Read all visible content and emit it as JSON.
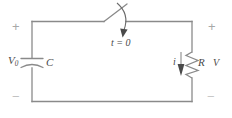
{
  "diagram": {
    "type": "schematic",
    "stroke_color": "#808080",
    "text_color": "#4a4a4a",
    "sign_color": "#a8a8a8",
    "background": "#ffffff",
    "width": 232,
    "height": 118
  },
  "labels": {
    "source_voltage": "V",
    "source_voltage_sub": "0",
    "capacitor": "C",
    "switch_time": "t = 0",
    "current": "i",
    "resistor": "R",
    "resistor_voltage": "V"
  },
  "polarity": {
    "top_left": "+",
    "top_right": "+",
    "bottom_left": "−",
    "bottom_right": "−"
  },
  "components": [
    {
      "name": "capacitor",
      "symbol": "curved-plate-capacitor",
      "label": "C",
      "voltage_label": "V0",
      "side": "left"
    },
    {
      "name": "switch",
      "symbol": "open-switch",
      "label": "t = 0",
      "side": "top"
    },
    {
      "name": "resistor",
      "symbol": "zigzag-resistor",
      "label": "R",
      "voltage_label": "V",
      "current_label": "i",
      "side": "right"
    }
  ],
  "annotations": {
    "current_direction": "downward through resistor",
    "switch_action_arrow": "curved arrow pointing down to t = 0"
  }
}
